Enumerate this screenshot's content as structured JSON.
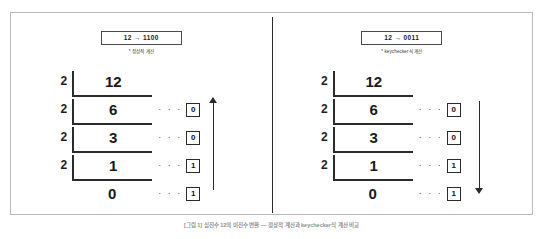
{
  "figure": {
    "caption": "[그림 1] 십진수 12의 이진수 변환 — 정상적 계산과 keychecker식 계산 비교"
  },
  "panels": [
    {
      "id": "normal",
      "header_label": "12 → 1100",
      "header_note": "* 정상적 계산",
      "arrow_direction": "up",
      "rows": [
        {
          "divisor": "2",
          "dividend": "12",
          "dots": "· · ·",
          "remainder": "",
          "has_bracket": true,
          "has_remainder": false
        },
        {
          "divisor": "2",
          "dividend": "6",
          "dots": "· · ·",
          "remainder": "0",
          "has_bracket": true,
          "has_remainder": true
        },
        {
          "divisor": "2",
          "dividend": "3",
          "dots": "· · ·",
          "remainder": "0",
          "has_bracket": true,
          "has_remainder": true
        },
        {
          "divisor": "2",
          "dividend": "1",
          "dots": "· · ·",
          "remainder": "1",
          "has_bracket": true,
          "has_remainder": true
        },
        {
          "divisor": "",
          "dividend": "0",
          "dots": "· · ·",
          "remainder": "1",
          "has_bracket": false,
          "has_remainder": true
        }
      ]
    },
    {
      "id": "keychecker",
      "header_label": "12 → 0011",
      "header_note": "* keychecker식 계산",
      "arrow_direction": "down",
      "rows": [
        {
          "divisor": "2",
          "dividend": "12",
          "dots": "· · ·",
          "remainder": "",
          "has_bracket": true,
          "has_remainder": false
        },
        {
          "divisor": "2",
          "dividend": "6",
          "dots": "· · ·",
          "remainder": "0",
          "has_bracket": true,
          "has_remainder": true
        },
        {
          "divisor": "2",
          "dividend": "3",
          "dots": "· · ·",
          "remainder": "0",
          "has_bracket": true,
          "has_remainder": true
        },
        {
          "divisor": "2",
          "dividend": "1",
          "dots": "· · ·",
          "remainder": "1",
          "has_bracket": true,
          "has_remainder": true
        },
        {
          "divisor": "",
          "dividend": "0",
          "dots": "· · ·",
          "remainder": "1",
          "has_bracket": false,
          "has_remainder": true
        }
      ]
    }
  ],
  "colors": {
    "frame_border": "#b9b9b9",
    "ink": "#2b2b2b",
    "caption": "#8e8e8e"
  }
}
